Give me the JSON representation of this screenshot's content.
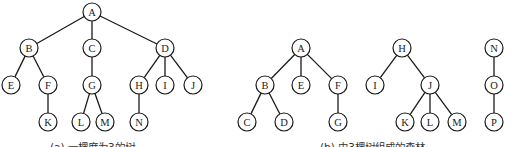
{
  "figure": {
    "node_radius": 9,
    "colors": {
      "stroke": "#1a1a1a",
      "fill": "#ffffff",
      "text": "#1a1a1a"
    },
    "panels": [
      {
        "id": "a",
        "caption": "(a) 一棵度为3的树",
        "caption_pos": [
          50,
          151
        ],
        "nodes": [
          {
            "id": "A",
            "label": "A",
            "x": 92,
            "y": 12
          },
          {
            "id": "B",
            "label": "B",
            "x": 29,
            "y": 48
          },
          {
            "id": "C",
            "label": "C",
            "x": 92,
            "y": 48
          },
          {
            "id": "D",
            "label": "D",
            "x": 165,
            "y": 48
          },
          {
            "id": "E",
            "label": "E",
            "x": 11,
            "y": 85
          },
          {
            "id": "F",
            "label": "F",
            "x": 48,
            "y": 85
          },
          {
            "id": "G",
            "label": "G",
            "x": 92,
            "y": 85
          },
          {
            "id": "H",
            "label": "H",
            "x": 139,
            "y": 85
          },
          {
            "id": "I",
            "label": "I",
            "x": 165,
            "y": 85
          },
          {
            "id": "J",
            "label": "J",
            "x": 193,
            "y": 85
          },
          {
            "id": "K",
            "label": "K",
            "x": 48,
            "y": 122
          },
          {
            "id": "L",
            "label": "L",
            "x": 81,
            "y": 122
          },
          {
            "id": "M",
            "label": "M",
            "x": 105,
            "y": 122
          },
          {
            "id": "N",
            "label": "N",
            "x": 139,
            "y": 122
          }
        ],
        "edges": [
          [
            "A",
            "B"
          ],
          [
            "A",
            "C"
          ],
          [
            "A",
            "D"
          ],
          [
            "B",
            "E"
          ],
          [
            "B",
            "F"
          ],
          [
            "F",
            "K"
          ],
          [
            "C",
            "G"
          ],
          [
            "G",
            "L"
          ],
          [
            "G",
            "M"
          ],
          [
            "D",
            "H"
          ],
          [
            "D",
            "I"
          ],
          [
            "D",
            "J"
          ],
          [
            "H",
            "N"
          ]
        ]
      },
      {
        "id": "b",
        "caption": "(b) 由3棵树组成的森林",
        "caption_pos": [
          320,
          151
        ],
        "nodes": [
          {
            "id": "A2",
            "label": "A",
            "x": 301,
            "y": 48
          },
          {
            "id": "B2",
            "label": "B",
            "x": 265,
            "y": 85
          },
          {
            "id": "E2",
            "label": "E",
            "x": 301,
            "y": 85
          },
          {
            "id": "F2",
            "label": "F",
            "x": 338,
            "y": 85
          },
          {
            "id": "C2",
            "label": "C",
            "x": 247,
            "y": 122
          },
          {
            "id": "D2",
            "label": "D",
            "x": 284,
            "y": 122
          },
          {
            "id": "G2",
            "label": "G",
            "x": 338,
            "y": 122
          },
          {
            "id": "H2",
            "label": "H",
            "x": 402,
            "y": 48
          },
          {
            "id": "I2",
            "label": "I",
            "x": 375,
            "y": 85
          },
          {
            "id": "J2",
            "label": "J",
            "x": 430,
            "y": 85
          },
          {
            "id": "K2",
            "label": "K",
            "x": 405,
            "y": 122
          },
          {
            "id": "L2",
            "label": "L",
            "x": 430,
            "y": 122
          },
          {
            "id": "M2",
            "label": "M",
            "x": 457,
            "y": 122
          },
          {
            "id": "N2",
            "label": "N",
            "x": 494,
            "y": 48
          },
          {
            "id": "O2",
            "label": "O",
            "x": 494,
            "y": 85
          },
          {
            "id": "P2",
            "label": "P",
            "x": 494,
            "y": 122
          }
        ],
        "edges": [
          [
            "A2",
            "B2"
          ],
          [
            "A2",
            "E2"
          ],
          [
            "A2",
            "F2"
          ],
          [
            "B2",
            "C2"
          ],
          [
            "B2",
            "D2"
          ],
          [
            "F2",
            "G2"
          ],
          [
            "H2",
            "I2"
          ],
          [
            "H2",
            "J2"
          ],
          [
            "J2",
            "K2"
          ],
          [
            "J2",
            "L2"
          ],
          [
            "J2",
            "M2"
          ],
          [
            "N2",
            "O2"
          ],
          [
            "O2",
            "P2"
          ]
        ]
      }
    ]
  }
}
